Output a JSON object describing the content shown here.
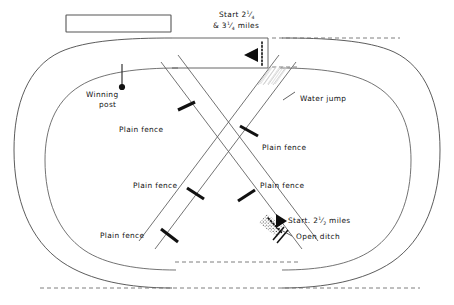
{
  "figure": {
    "type": "racecourse-diagram",
    "background_color": "#ffffff",
    "line_color": "#4a4a4a",
    "fence_color": "#111111"
  },
  "labels": {
    "winning_post": "Winning\npost",
    "winning_post_line1": "Winning",
    "winning_post_line2": "post",
    "water_jump": "Water jump",
    "open_ditch": "Open ditch",
    "start_top_line1": "Start 2",
    "start_top_frac1_num": "1",
    "start_top_frac1_den": "4",
    "start_top_line2_prefix": "& 3",
    "start_top_frac2_num": "1",
    "start_top_frac2_den": "4",
    "start_top_line2_suffix": " miles",
    "start_lower_prefix": "Start. 2",
    "start_lower_frac_num": "1",
    "start_lower_frac_den": "2",
    "start_lower_suffix": " miles",
    "plain_fence": "Plain fence"
  },
  "fences": [
    {
      "id": "plain-fence-upper-left",
      "label": "Plain fence",
      "label_x": 73,
      "label_y": 130
    },
    {
      "id": "plain-fence-upper-right",
      "label": "Plain fence",
      "label_x": 262,
      "label_y": 148
    },
    {
      "id": "plain-fence-mid-left",
      "label": "Plain fence",
      "label_x": 83,
      "label_y": 186
    },
    {
      "id": "plain-fence-mid-right",
      "label": "Plain fence",
      "label_x": 262,
      "label_y": 186
    },
    {
      "id": "plain-fence-lower-left",
      "label": "Plain fence",
      "label_x": 100,
      "label_y": 236
    }
  ],
  "starts": [
    {
      "id": "start-2-1-4-and-3-1-4-miles",
      "distances": [
        "2 1/4 miles",
        "3 1/4 miles"
      ],
      "arrow_direction": "left",
      "position": "top-centre-chute"
    },
    {
      "id": "start-2-1-2-miles",
      "distances": [
        "2 1/2 miles"
      ],
      "arrow_direction": "right",
      "position": "lower-right-diagonal"
    }
  ],
  "obstacles": [
    {
      "id": "water-jump",
      "label": "Water jump",
      "kind": "water"
    },
    {
      "id": "open-ditch",
      "label": "Open ditch",
      "kind": "ditch"
    },
    {
      "id": "plain-fence",
      "label": "Plain fence",
      "kind": "plain",
      "count": 5
    }
  ],
  "markers": {
    "winning_post": {
      "label": "Winning post",
      "kind": "post-with-dot"
    },
    "grandstand": {
      "label": "",
      "kind": "empty-rectangle"
    }
  }
}
